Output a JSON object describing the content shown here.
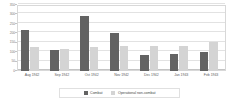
{
  "chart_data": {
    "type": "bar",
    "title": "",
    "subtitle": "",
    "xlabel": "",
    "ylabel": "",
    "ylim": [
      0,
      350
    ],
    "ytick_labels": [
      "350",
      "300",
      "250",
      "200",
      "150",
      "100",
      "50",
      "0"
    ],
    "ytick_values": [
      350,
      300,
      250,
      200,
      150,
      100,
      50,
      0
    ],
    "grid": true,
    "legend_position": "bottom",
    "categories": [
      "Aug 1942",
      "Sep 1942",
      "Oct 1942",
      "Nov 1942",
      "Dec 1942",
      "Jan 1943",
      "Feb 1943"
    ],
    "series": [
      {
        "name": "Combat",
        "color": "#636363",
        "values": [
          215,
          112,
          290,
          200,
          83,
          88,
          102
        ]
      },
      {
        "name": "Operational non-combat",
        "color": "#d4d4d4",
        "values": [
          130,
          115,
          130,
          133,
          133,
          135,
          153
        ]
      }
    ]
  },
  "colors": {
    "combat": "#636363",
    "noncombat": "#d4d4d4",
    "gridline": "#e2e2e2",
    "axis": "#c4c4c4",
    "frame": "#d8d8d8",
    "tick_text": "#7a7a7a",
    "label_text": "#5e5e5e",
    "legend_text": "#4a4a4a",
    "background": "#ffffff"
  }
}
